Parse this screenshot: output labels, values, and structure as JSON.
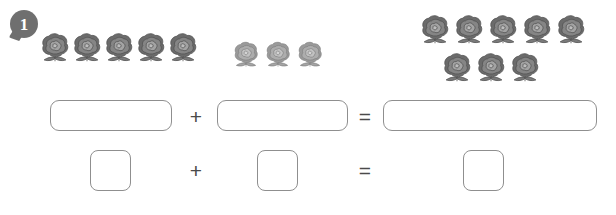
{
  "worksheet": {
    "exercise_number": "1",
    "badge_color": "#6f6f6f",
    "box_border_color": "#8f8f8f",
    "operator_color": "#4a4a4a",
    "background_color": "#ffffff"
  },
  "object_groups": [
    {
      "name": "addend-1-roses",
      "icon": "rose-icon",
      "count": 5,
      "tone": "dark",
      "rows": [
        {
          "positions_x": [
            38,
            70,
            102,
            134,
            166
          ],
          "y": 30,
          "size": 34
        }
      ]
    },
    {
      "name": "addend-2-roses",
      "icon": "rose-icon",
      "count": 3,
      "tone": "light",
      "rows": [
        {
          "positions_x": [
            231,
            263,
            295
          ],
          "y": 39,
          "size": 30
        }
      ]
    },
    {
      "name": "sum-roses",
      "icon": "rose-icon",
      "count": 8,
      "tone": "dark",
      "rows": [
        {
          "positions_x": [
            418,
            452,
            486,
            520,
            554
          ],
          "y": 12,
          "size": 34
        },
        {
          "positions_x": [
            440,
            474,
            508
          ],
          "y": 50,
          "size": 34
        }
      ]
    }
  ],
  "equation_rows": [
    {
      "name": "word-equation-row",
      "boxes": [
        {
          "name": "answer-box-addend-1",
          "value": "",
          "x": 50,
          "y": 100,
          "w": 122,
          "h": 31
        },
        {
          "name": "answer-box-addend-2",
          "value": "",
          "x": 217,
          "y": 100,
          "w": 131,
          "h": 31
        },
        {
          "name": "answer-box-sum",
          "value": "",
          "x": 383,
          "y": 100,
          "w": 214,
          "h": 31
        }
      ],
      "operators": [
        {
          "name": "plus-operator",
          "symbol": "+",
          "x": 186,
          "y": 106,
          "w": 20
        },
        {
          "name": "equals-operator",
          "symbol": "=",
          "x": 355,
          "y": 106,
          "w": 20
        }
      ]
    },
    {
      "name": "numeral-equation-row",
      "boxes": [
        {
          "name": "number-box-addend-1",
          "value": "",
          "x": 90,
          "y": 150,
          "w": 41,
          "h": 41
        },
        {
          "name": "number-box-addend-2",
          "value": "",
          "x": 257,
          "y": 150,
          "w": 41,
          "h": 41
        },
        {
          "name": "number-box-sum",
          "value": "",
          "x": 463,
          "y": 150,
          "w": 41,
          "h": 41
        }
      ],
      "operators": [
        {
          "name": "plus-operator",
          "symbol": "+",
          "x": 186,
          "y": 160,
          "w": 20
        },
        {
          "name": "equals-operator",
          "symbol": "=",
          "x": 355,
          "y": 160,
          "w": 20
        }
      ]
    }
  ]
}
